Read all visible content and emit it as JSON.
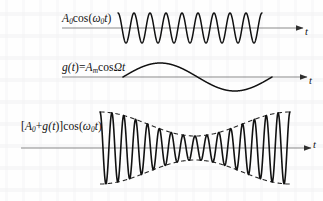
{
  "figure": {
    "background_color": "#fefefe",
    "stroke_color": "#111111",
    "axis_color": "#6b6b6b",
    "envelope_color": "#2b2b2b"
  },
  "panels": [
    {
      "id": "carrier",
      "label": "A0cos(ω0t)",
      "label_parts": {
        "amp": "A",
        "amp_sub": "0",
        "fn": "cos(",
        "omega": "ω",
        "omega_sub": "0",
        "var": "t",
        "close": ")"
      },
      "axis_label": "t",
      "axis_y": 28,
      "axis_x_start": 62,
      "axis_x_end": 305,
      "wave": {
        "type": "cosine",
        "x_start": 118,
        "x_end": 262,
        "cycles": 9,
        "amplitude": 15,
        "phase": "peak-start"
      }
    },
    {
      "id": "modulator",
      "label": "g(t)=AmcosΩt",
      "label_parts": {
        "g": "g(",
        "var": "t",
        "eq": ")=",
        "amp": "A",
        "amp_sub": "m",
        "fn": "cos",
        "omega": "Ω",
        "var2": "t"
      },
      "axis_label": "t",
      "axis_y": 77,
      "axis_x_start": 62,
      "axis_x_end": 309,
      "wave": {
        "type": "sine",
        "x_start": 123,
        "x_end": 272,
        "cycles": 1,
        "amplitude": 14,
        "phase": "rising-zero-start"
      }
    },
    {
      "id": "amplitude-modulated",
      "label": "[A0+g(t)]cos(ω0t)",
      "label_parts": {
        "open": "[",
        "amp": "A",
        "amp_sub": "0",
        "plus": "+",
        "g": "g(",
        "var": "t",
        "close1": ")]",
        "fn": "cos(",
        "omega": "ω",
        "omega_sub": "0",
        "var2": "t",
        "close2": ")"
      },
      "axis_label": "t",
      "axis_y": 148,
      "axis_x_start": 21,
      "axis_x_end": 313,
      "wave": {
        "type": "am",
        "x_start": 100,
        "x_end": 290,
        "carrier_cycles": 16,
        "carrier_amplitude_max": 36,
        "carrier_amplitude_min": 12,
        "modulation_cycles": 1,
        "modulation_phase": "peak-start",
        "envelope_dashed": true
      }
    }
  ],
  "chart_data": {
    "type": "line",
    "xlabel": "t",
    "ylabel": "",
    "grid": false,
    "legend": "none",
    "series": [
      {
        "name": "A0cos(ω0t)",
        "description": "carrier wave, constant amplitude, 9 cycles",
        "amplitude": 1.0,
        "cycles": 9
      },
      {
        "name": "g(t)=AmcosΩt",
        "description": "modulating signal, single cosine cycle",
        "amplitude": 1.0,
        "cycles": 1
      },
      {
        "name": "[A0+g(t)]cos(ω0t)",
        "description": "amplitude modulated wave with dashed envelope",
        "amplitude_max": 1.0,
        "amplitude_min": 0.33,
        "carrier_cycles": 16,
        "modulation_cycles": 1
      }
    ]
  }
}
